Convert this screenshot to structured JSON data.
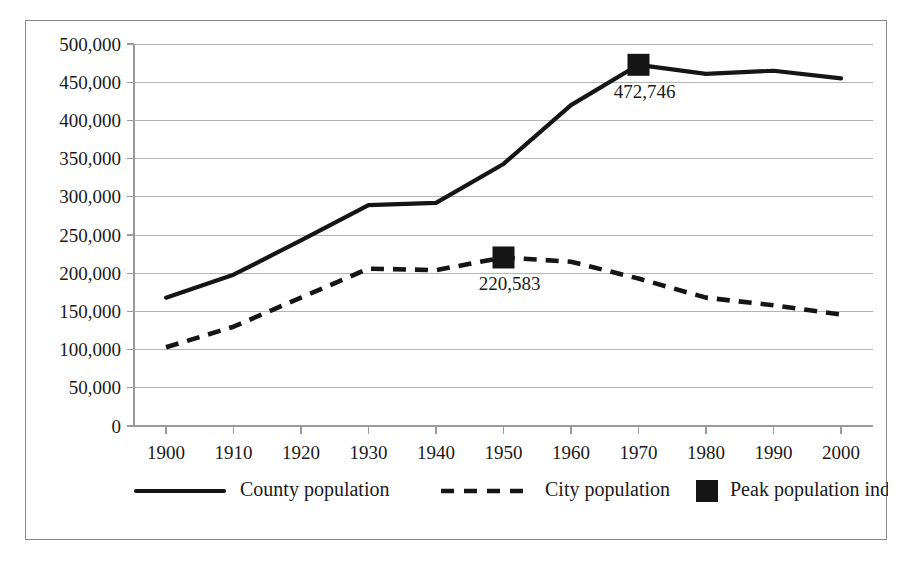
{
  "chart_data": {
    "type": "line",
    "title": "",
    "subtitle": "",
    "xlabel": "",
    "ylabel": "",
    "x": [
      1900,
      1910,
      1920,
      1930,
      1940,
      1950,
      1960,
      1970,
      1980,
      1990,
      2000
    ],
    "xtick_labels": [
      "1900",
      "1910",
      "1920",
      "1930",
      "1940",
      "1950",
      "1960",
      "1970",
      "1980",
      "1990",
      "2000"
    ],
    "ylim": [
      0,
      500000
    ],
    "ytick_values": [
      0,
      50000,
      100000,
      150000,
      200000,
      250000,
      300000,
      350000,
      400000,
      450000,
      500000
    ],
    "ytick_labels": [
      "0",
      "50,000",
      "100,000",
      "150,000",
      "200,000",
      "250,000",
      "300,000",
      "350,000",
      "400,000",
      "450,000",
      "500,000"
    ],
    "grid": true,
    "grid_axis": "y",
    "legend_position": "bottom",
    "series": [
      {
        "name": "County population",
        "style": "solid",
        "color": "#151515",
        "values": [
          168000,
          198000,
          243000,
          289000,
          292000,
          343000,
          420000,
          472746,
          461000,
          465000,
          455000
        ]
      },
      {
        "name": "City population",
        "style": "dashed",
        "color": "#151515",
        "values": [
          103000,
          130000,
          168000,
          206000,
          204000,
          220583,
          215000,
          193000,
          168000,
          158000,
          146000
        ]
      }
    ],
    "annotations": [
      {
        "name": "county-peak",
        "series": "County population",
        "x": 1970,
        "y": 472746,
        "label": "472,746",
        "marker": "square"
      },
      {
        "name": "city-peak",
        "series": "City population",
        "x": 1950,
        "y": 220583,
        "label": "220,583",
        "marker": "square"
      }
    ],
    "legend": [
      {
        "label": "County population",
        "style": "solid-line"
      },
      {
        "label": "City population",
        "style": "dashed-line"
      },
      {
        "label": "Peak population indicated",
        "style": "square-marker"
      }
    ]
  }
}
